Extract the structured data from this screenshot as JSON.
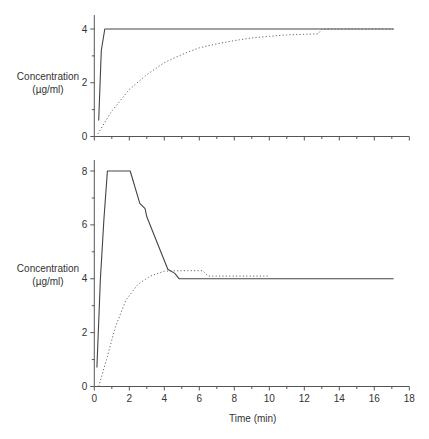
{
  "chart_data": [
    {
      "type": "line",
      "title": "",
      "xlabel": "",
      "ylabel": "Concentration (µg/ml)",
      "ylabel_lines": [
        "Concentration",
        "(µg/ml)"
      ],
      "xlim": [
        0,
        18
      ],
      "ylim": [
        0,
        4
      ],
      "yticks": [
        0,
        2,
        4
      ],
      "yminor": [
        1,
        3
      ],
      "xticks": [
        0,
        2,
        4,
        6,
        8,
        10,
        12,
        14,
        16,
        18
      ],
      "show_xtick_labels": false,
      "grid": false,
      "series": [
        {
          "name": "solid",
          "style": "solid",
          "points": [
            [
              0.25,
              0.6
            ],
            [
              0.4,
              3.2
            ],
            [
              0.6,
              4.0
            ],
            [
              17.1,
              4.0
            ]
          ]
        },
        {
          "name": "dotted",
          "style": "dotted",
          "points": [
            [
              0.2,
              0.1
            ],
            [
              1,
              0.95
            ],
            [
              2,
              1.75
            ],
            [
              3,
              2.3
            ],
            [
              4,
              2.75
            ],
            [
              5,
              3.05
            ],
            [
              6,
              3.3
            ],
            [
              7,
              3.45
            ],
            [
              8,
              3.57
            ],
            [
              9,
              3.67
            ],
            [
              10,
              3.73
            ],
            [
              11,
              3.78
            ],
            [
              12.8,
              3.82
            ],
            [
              13,
              4.0
            ],
            [
              17.1,
              4.0
            ]
          ]
        }
      ]
    },
    {
      "type": "line",
      "title": "",
      "xlabel": "Time (min)",
      "ylabel": "Concentration (µg/ml)",
      "ylabel_lines": [
        "Concentration",
        "(µg/ml)"
      ],
      "xlim": [
        0,
        18
      ],
      "ylim": [
        0,
        8
      ],
      "yticks": [
        0,
        2,
        4,
        6,
        8
      ],
      "yminor": [
        1,
        3,
        5,
        7
      ],
      "xticks": [
        0,
        2,
        4,
        6,
        8,
        10,
        12,
        14,
        16,
        18
      ],
      "show_xtick_labels": true,
      "grid": false,
      "series": [
        {
          "name": "solid",
          "style": "solid",
          "points": [
            [
              0.15,
              0.7
            ],
            [
              0.35,
              4.0
            ],
            [
              0.55,
              6.2
            ],
            [
              0.75,
              8.0
            ],
            [
              2.05,
              8.0
            ],
            [
              2.6,
              6.8
            ],
            [
              2.9,
              6.6
            ],
            [
              3.0,
              6.3
            ],
            [
              4.2,
              4.35
            ],
            [
              4.6,
              4.2
            ],
            [
              4.85,
              4.0
            ],
            [
              17.1,
              4.0
            ]
          ]
        },
        {
          "name": "dotted",
          "style": "dotted",
          "points": [
            [
              0.25,
              0.0
            ],
            [
              0.7,
              1.0
            ],
            [
              1.2,
              2.2
            ],
            [
              1.8,
              3.2
            ],
            [
              2.5,
              3.8
            ],
            [
              3.2,
              4.1
            ],
            [
              4.0,
              4.28
            ],
            [
              5.0,
              4.3
            ],
            [
              6.2,
              4.3
            ],
            [
              6.5,
              4.1
            ],
            [
              10.0,
              4.1
            ]
          ]
        }
      ]
    }
  ]
}
